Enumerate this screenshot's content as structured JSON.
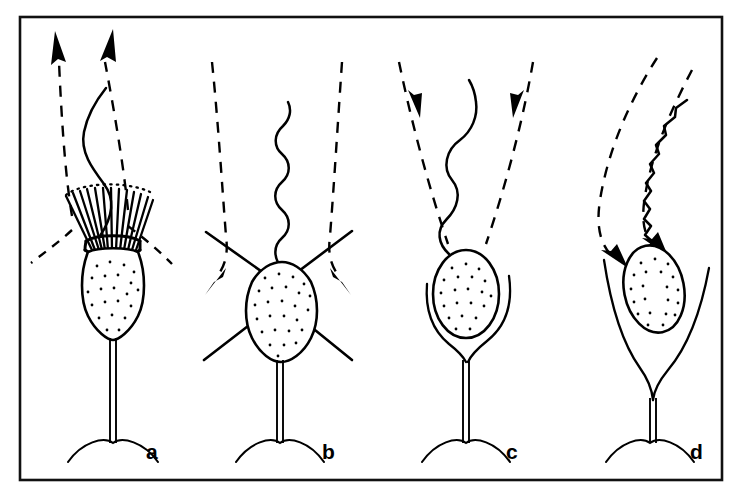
{
  "figure": {
    "background_color": "#ffffff",
    "ink_color": "#000000",
    "frame": {
      "name": "figure-border",
      "x": 20,
      "y": 17,
      "width": 702,
      "height": 463,
      "stroke_color": "#111111",
      "stroke_width": 2.6
    },
    "style": {
      "line_art": true,
      "flow_line_style": "dashed",
      "cell_fill": "#ffffff",
      "cytoplasm_stipple": true
    }
  },
  "panels": [
    {
      "id": "a",
      "label": "a",
      "label_x": 146,
      "label_y": 459,
      "center_x": 118,
      "cell_type": "collar cell with microvillar collar",
      "flagellum": {
        "waveform": "broad sinusoidal",
        "wave_count": 2,
        "amplitude": "large",
        "orientation": "vertical"
      },
      "collar": {
        "present": true,
        "microvilli_count": 13,
        "shape": "funnel",
        "rim_dotted_arc": true
      },
      "spines": 0,
      "lorica": "none",
      "flow": {
        "direction": "outward-upward",
        "arrow_count": 2,
        "arrow_direction": "up",
        "inflow_lines": 2,
        "description": "water drawn in laterally through collar, expelled upward along flagellum"
      },
      "stalk": true,
      "base_arc": true
    },
    {
      "id": "b",
      "label": "b",
      "label_x": 322,
      "label_y": 459,
      "center_x": 281,
      "cell_type": "cell with four radiating spines",
      "flagellum": {
        "waveform": "tight sinusoidal",
        "wave_count": 6,
        "amplitude": "small",
        "orientation": "vertical"
      },
      "collar": {
        "present": false,
        "microvilli_count": 0,
        "shape": "none",
        "rim_dotted_arc": false
      },
      "spines": 4,
      "lorica": "none",
      "flow": {
        "direction": "downward-outward",
        "arrow_count": 2,
        "arrow_direction": "down-outward",
        "inflow_lines": 2,
        "description": "water driven down past the cell body and swept outward to both sides"
      },
      "stalk": true,
      "base_arc": true
    },
    {
      "id": "c",
      "label": "c",
      "label_x": 506,
      "label_y": 459,
      "center_x": 466,
      "cell_type": "cell seated in an open cup-shaped lorica",
      "flagellum": {
        "waveform": "broad sinusoidal",
        "wave_count": 3,
        "amplitude": "medium",
        "orientation": "vertical"
      },
      "collar": {
        "present": false,
        "microvilli_count": 0,
        "shape": "none",
        "rim_dotted_arc": false
      },
      "spines": 0,
      "lorica": "open cup of two curved arms",
      "flow": {
        "direction": "inward-downward",
        "arrow_count": 2,
        "arrow_direction": "down-inward",
        "inflow_lines": 2,
        "description": "water drawn downward and inward toward the cell from both sides"
      },
      "stalk": true,
      "base_arc": true
    },
    {
      "id": "d",
      "label": "d",
      "label_x": 690,
      "label_y": 459,
      "center_x": 648,
      "cell_type": "tilted cell inside a narrow lorica, flagellum traversing the body",
      "flagellum": {
        "waveform": "tight zigzag",
        "wave_count": 14,
        "amplitude": "small",
        "orientation": "oblique, curving to upper right"
      },
      "collar": {
        "present": false,
        "microvilli_count": 0,
        "shape": "none",
        "rim_dotted_arc": false
      },
      "spines": 0,
      "lorica": "narrow elongated cup of two curved arms",
      "flow": {
        "direction": "inward-downward-left",
        "arrow_count": 2,
        "arrow_direction": "down-left",
        "inflow_lines": 2,
        "description": "water pulled obliquely down toward the tilted cell body"
      },
      "stalk": true,
      "base_arc": true
    }
  ]
}
